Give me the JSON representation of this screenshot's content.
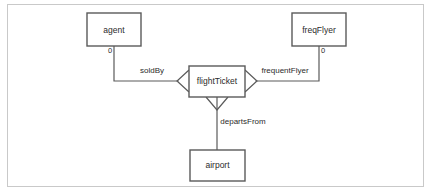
{
  "diagram": {
    "type": "entity-relationship-crows-foot",
    "background_color": "#ffffff",
    "frame_color": "#c9c9c9",
    "line_color": "#5a5a5a",
    "text_color": "#2b2b2b",
    "entities": [
      {
        "id": "agent",
        "label": "agent",
        "x": 87,
        "y": 13,
        "w": 54,
        "h": 33
      },
      {
        "id": "freqFlyer",
        "label": "freqFlyer",
        "x": 292,
        "y": 13,
        "w": 54,
        "h": 33
      },
      {
        "id": "flightTicket",
        "label": "flightTicket",
        "x": 189,
        "y": 66,
        "w": 56,
        "h": 31
      },
      {
        "id": "airport",
        "label": "airport",
        "x": 190,
        "y": 150,
        "w": 55,
        "h": 31
      }
    ],
    "relationships": [
      {
        "id": "soldBy",
        "label": "soldBy",
        "from": "flightTicket",
        "to": "agent",
        "label_x": 152,
        "label_y": 71,
        "cardinality": "0",
        "cardinality_x": 110,
        "cardinality_y": 51,
        "crowfoot_side": "left"
      },
      {
        "id": "frequentFlyer",
        "label": "frequentFlyer",
        "from": "flightTicket",
        "to": "freqFlyer",
        "label_x": 285,
        "label_y": 71,
        "cardinality": "0",
        "cardinality_x": 323,
        "cardinality_y": 51,
        "crowfoot_side": "right"
      },
      {
        "id": "departsFrom",
        "label": "departsFrom",
        "from": "flightTicket",
        "to": "airport",
        "label_x": 243,
        "label_y": 122,
        "cardinality": "",
        "cardinality_x": 0,
        "cardinality_y": 0,
        "crowfoot_side": "bottom"
      }
    ]
  }
}
